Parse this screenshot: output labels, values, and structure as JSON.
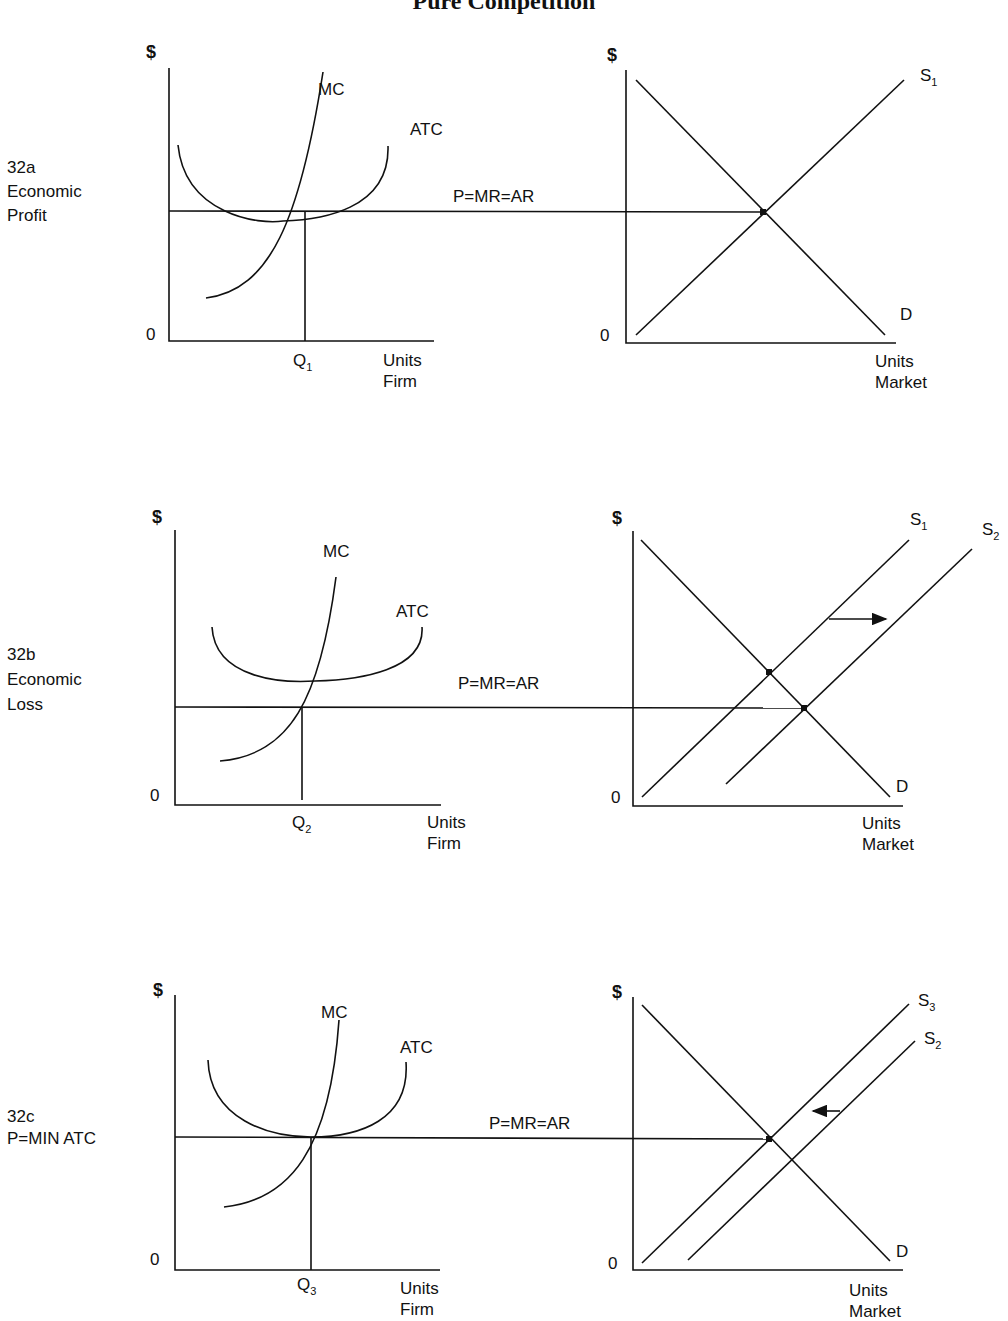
{
  "title": "Pure Competition",
  "panels": [
    {
      "id": "32a",
      "side_label": [
        "32a",
        "Economic",
        "Profit"
      ],
      "firm": {
        "y_label": "$",
        "origin": "0",
        "mc": "MC",
        "atc": "ATC",
        "q_label": "Q",
        "q_sub": "1",
        "x_label": [
          "Units",
          "Firm"
        ]
      },
      "price_line": "P=MR=AR",
      "market": {
        "y_label": "$",
        "origin": "0",
        "supply": [
          {
            "name": "S",
            "sub": "1"
          }
        ],
        "demand": "D",
        "x_label": [
          "Units",
          "Market"
        ]
      }
    },
    {
      "id": "32b",
      "side_label": [
        "32b",
        "Economic",
        "Loss"
      ],
      "firm": {
        "y_label": "$",
        "origin": "0",
        "mc": "MC",
        "atc": "ATC",
        "q_label": "Q",
        "q_sub": "2",
        "x_label": [
          "Units",
          "Firm"
        ]
      },
      "price_line": "P=MR=AR",
      "market": {
        "y_label": "$",
        "origin": "0",
        "supply": [
          {
            "name": "S",
            "sub": "1"
          },
          {
            "name": "S",
            "sub": "2"
          }
        ],
        "demand": "D",
        "shift": "right",
        "x_label": [
          "Units",
          "Market"
        ]
      }
    },
    {
      "id": "32c",
      "side_label": [
        "32c",
        "P=MIN ATC"
      ],
      "firm": {
        "y_label": "$",
        "origin": "0",
        "mc": "MC",
        "atc": "ATC",
        "q_label": "Q",
        "q_sub": "3",
        "x_label": [
          "Units",
          "Firm"
        ]
      },
      "price_line": "P=MR=AR",
      "market": {
        "y_label": "$",
        "origin": "0",
        "supply": [
          {
            "name": "S",
            "sub": "3"
          },
          {
            "name": "S",
            "sub": "2"
          }
        ],
        "demand": "D",
        "shift": "left",
        "x_label": [
          "Units",
          "Market"
        ]
      }
    }
  ]
}
